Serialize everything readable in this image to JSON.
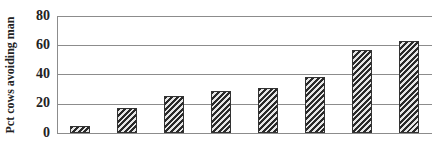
{
  "chart_data": {
    "type": "bar",
    "title": "",
    "xlabel": "",
    "ylabel": "Pct cows avoiding man",
    "categories": [
      "1",
      "2",
      "3",
      "4",
      "5",
      "6",
      "7",
      "8"
    ],
    "values": [
      5,
      17,
      25,
      29,
      31,
      38,
      57,
      63
    ],
    "ylim": [
      0,
      80
    ],
    "yticks": [
      0,
      20,
      40,
      60,
      80
    ],
    "grid": true,
    "legend": null,
    "bar_fill": "diagonal-hatch"
  },
  "axis": {
    "ylabel": "Pct cows avoiding man",
    "ticks": [
      "80",
      "60",
      "40",
      "20",
      "0"
    ]
  }
}
